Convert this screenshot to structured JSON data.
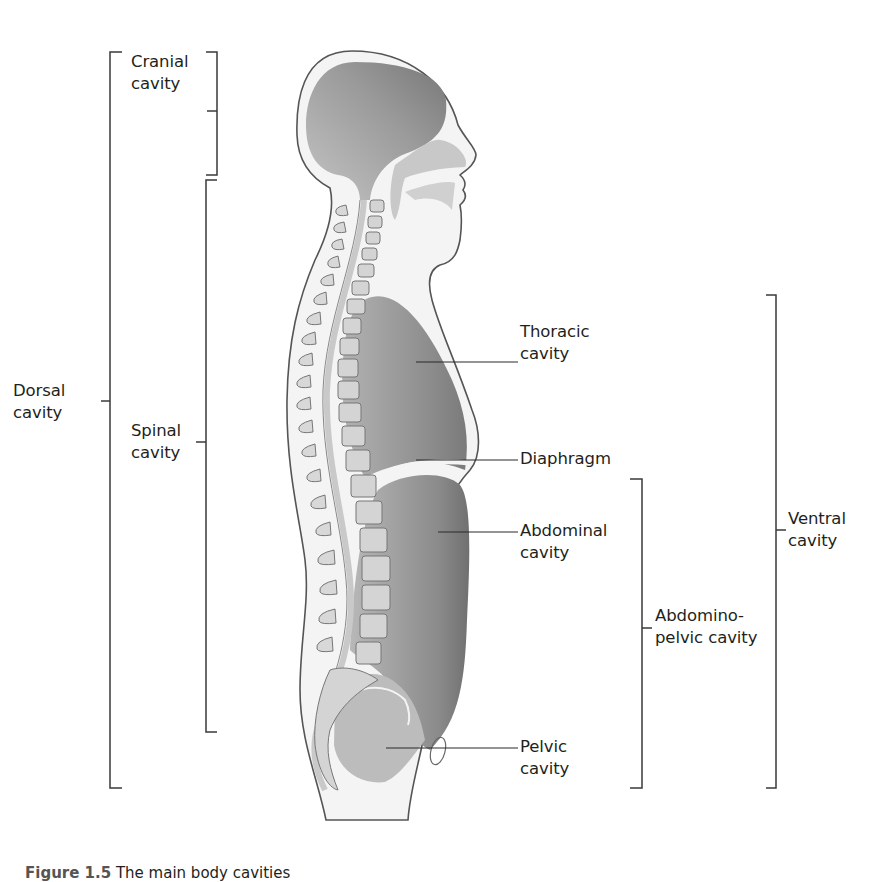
{
  "figure": {
    "labels": {
      "cranial": [
        "Cranial",
        "cavity"
      ],
      "dorsal": [
        "Dorsal",
        "cavity"
      ],
      "spinal": [
        "Spinal",
        "cavity"
      ],
      "thoracic": [
        "Thoracic",
        "cavity"
      ],
      "diaphragm": [
        "Diaphragm"
      ],
      "abdominal": [
        "Abdominal",
        "cavity"
      ],
      "abdominopelvic": [
        "Abdomino-",
        "pelvic cavity"
      ],
      "ventral": [
        "Ventral",
        "cavity"
      ],
      "pelvic": [
        "Pelvic",
        "cavity"
      ]
    },
    "caption": {
      "number": "Figure 1.5",
      "text": "The main body cavities"
    },
    "colors": {
      "line": "#3a3a3a",
      "body_fill": "#f3f3f3",
      "cavity_dark": "#7a7a7a",
      "cavity_light": "#b9b9b9",
      "bone": "#d2d2d2"
    }
  }
}
